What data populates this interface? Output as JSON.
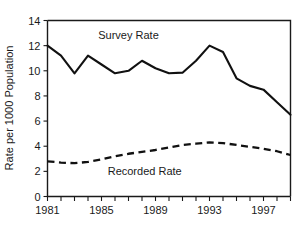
{
  "chart_data": {
    "type": "line",
    "title": "",
    "xlabel": "",
    "ylabel": "Rate per 1000 Population",
    "xlim": [
      1981,
      1999
    ],
    "ylim": [
      0,
      14
    ],
    "grid": false,
    "legend_position": "inline-annotation",
    "x": [
      1981,
      1982,
      1983,
      1984,
      1985,
      1986,
      1987,
      1988,
      1989,
      1990,
      1991,
      1992,
      1993,
      1994,
      1995,
      1996,
      1997,
      1998,
      1999
    ],
    "y_ticks": [
      0,
      2,
      4,
      6,
      8,
      10,
      12,
      14
    ],
    "y_tick_labels": [
      "0",
      "2",
      "4",
      "6",
      "8",
      "10",
      "12",
      "14"
    ],
    "x_ticks": [
      1981,
      1982,
      1983,
      1984,
      1985,
      1986,
      1987,
      1988,
      1989,
      1990,
      1991,
      1992,
      1993,
      1994,
      1995,
      1996,
      1997,
      1998,
      1999
    ],
    "x_tick_labels_shown": [
      "1981",
      "1985",
      "1989",
      "1993",
      "1997"
    ],
    "x_tick_label_years": [
      1981,
      1985,
      1989,
      1993,
      1997
    ],
    "series": [
      {
        "name": "Survey Rate",
        "style": "solid",
        "color": "#111111",
        "annotation_x": 1987.0,
        "annotation_y": 12.55,
        "values": [
          12.0,
          11.2,
          9.8,
          11.2,
          10.5,
          9.8,
          10.0,
          10.8,
          10.2,
          9.8,
          9.85,
          10.8,
          12.0,
          11.5,
          9.4,
          8.8,
          8.5,
          7.5,
          6.5
        ]
      },
      {
        "name": "Recorded Rate",
        "style": "dashed",
        "color": "#111111",
        "annotation_x": 1988.2,
        "annotation_y": 1.75,
        "values": [
          2.8,
          2.7,
          2.65,
          2.75,
          2.95,
          3.2,
          3.4,
          3.55,
          3.7,
          3.9,
          4.1,
          4.2,
          4.3,
          4.25,
          4.1,
          3.95,
          3.8,
          3.6,
          3.3
        ]
      }
    ]
  }
}
